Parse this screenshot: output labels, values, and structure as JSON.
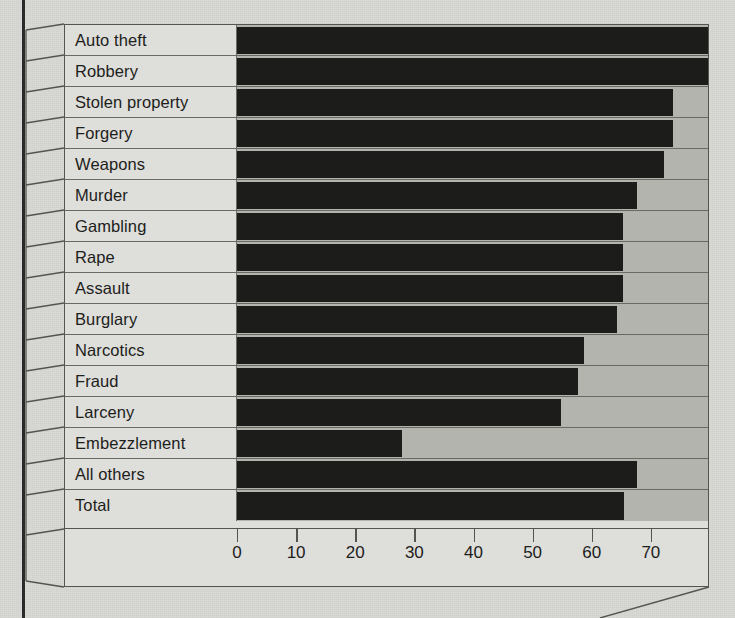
{
  "chart_data": {
    "type": "bar",
    "orientation": "horizontal",
    "title": "",
    "subtitle": "",
    "xlabel": "",
    "ylabel": "",
    "xlim": [
      0,
      80
    ],
    "grid": false,
    "legend": null,
    "axis": {
      "ticks": [
        0,
        10,
        20,
        30,
        40,
        50,
        60,
        70
      ],
      "tick_labels": [
        "0",
        "10",
        "20",
        "30",
        "40",
        "50",
        "60",
        "70"
      ],
      "max_plot_value": 80
    },
    "categories": [
      "Auto theft",
      "Robbery",
      "Stolen property",
      "Forgery",
      "Weapons",
      "Murder",
      "Gambling",
      "Rape",
      "Assault",
      "Burglary",
      "Narcotics",
      "Fraud",
      "Larceny",
      "Embezzlement",
      "All others",
      "Total"
    ],
    "values": [
      80,
      80,
      74,
      74,
      72.5,
      68,
      65.5,
      65.5,
      65.5,
      64.5,
      59,
      58,
      55,
      28,
      68,
      65.7
    ],
    "bar_color": "#1c1c1a",
    "plot_background_color": "#b4b4ae",
    "frame_color": "#55554f",
    "page_background_color": "#d8d8d5"
  }
}
